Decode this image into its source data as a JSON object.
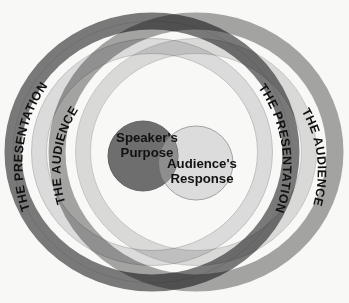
{
  "figure": {
    "name": "presentation-audience-venn-diagram",
    "background_color": "#f8f8f6",
    "width": 349,
    "height": 303
  },
  "colors": {
    "dark_ring": "#6e6e6e",
    "light_ring": "#d9d9d9",
    "ring_outline": "#8a8a8a",
    "speaker_circle": "#6e6e6e",
    "audience_circle": "#dcdcdc",
    "overlap": "#9a9a9a",
    "text": "#111111",
    "background": "#f8f8f6"
  },
  "rings": [
    {
      "id": "presentation-ring-left",
      "label": "THE PRESENTATION",
      "color": "#6e6e6e",
      "position": "outer-left"
    },
    {
      "id": "audience-ring-left",
      "label": "THE AUDIENCE",
      "color": "#d9d9d9",
      "position": "inner-left"
    },
    {
      "id": "presentation-ring-right",
      "label": "THE PRESENTATION",
      "color": "#6e6e6e",
      "position": "inner-right"
    },
    {
      "id": "audience-ring-right",
      "label": "THE AUDIENCE",
      "color": "#d9d9d9",
      "position": "outer-right"
    }
  ],
  "venn": {
    "speaker": {
      "id": "speakers-purpose-circle",
      "line1": "Speaker's",
      "line2": "Purpose",
      "color": "#6e6e6e"
    },
    "audience": {
      "id": "audiences-response-circle",
      "line1": "Audience's",
      "line2": "Response",
      "color": "#dcdcdc"
    }
  }
}
